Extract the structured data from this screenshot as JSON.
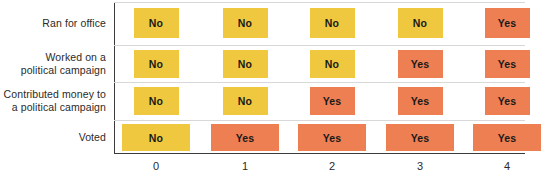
{
  "chart_data": {
    "type": "heatmap",
    "title": "",
    "subtitle": "",
    "xlabel": "",
    "ylabel": "",
    "grid": true,
    "legend_position": "none",
    "x_tick_labels": [
      "0",
      "1",
      "2",
      "3",
      "4"
    ],
    "x_values": [
      0,
      1,
      2,
      3,
      4
    ],
    "categories": [
      "Ran for office",
      "Worked on a\npolitical campaign",
      "Contributed money to\na political campaign",
      "Voted"
    ],
    "value_labels": [
      "No",
      "Yes"
    ],
    "colors": {
      "no": "#EFC840",
      "yes": "#ED7F52",
      "axis": "#3b3b3b",
      "gridline": "#d8d8d8",
      "text": "#2c2a29",
      "cell_text": "#1a1a1a",
      "background": "#ffffff"
    },
    "rows": [
      {
        "label": "Ran for office",
        "cells": [
          {
            "x": "0",
            "value": "No",
            "state": "no"
          },
          {
            "x": "1",
            "value": "No",
            "state": "no"
          },
          {
            "x": "2",
            "value": "No",
            "state": "no"
          },
          {
            "x": "3",
            "value": "No",
            "state": "no"
          },
          {
            "x": "4",
            "value": "Yes",
            "state": "yes"
          }
        ]
      },
      {
        "label": "Worked on a\npolitical campaign",
        "cells": [
          {
            "x": "0",
            "value": "No",
            "state": "no"
          },
          {
            "x": "1",
            "value": "No",
            "state": "no"
          },
          {
            "x": "2",
            "value": "No",
            "state": "no"
          },
          {
            "x": "3",
            "value": "Yes",
            "state": "yes"
          },
          {
            "x": "4",
            "value": "Yes",
            "state": "yes"
          }
        ]
      },
      {
        "label": "Contributed money to\na political campaign",
        "cells": [
          {
            "x": "0",
            "value": "No",
            "state": "no"
          },
          {
            "x": "1",
            "value": "No",
            "state": "no"
          },
          {
            "x": "2",
            "value": "Yes",
            "state": "yes"
          },
          {
            "x": "3",
            "value": "Yes",
            "state": "yes"
          },
          {
            "x": "4",
            "value": "Yes",
            "state": "yes"
          }
        ]
      },
      {
        "label": "Voted",
        "cells": [
          {
            "x": "0",
            "value": "No",
            "state": "no"
          },
          {
            "x": "1",
            "value": "Yes",
            "state": "yes"
          },
          {
            "x": "2",
            "value": "Yes",
            "state": "yes"
          },
          {
            "x": "3",
            "value": "Yes",
            "state": "yes"
          },
          {
            "x": "4",
            "value": "Yes",
            "state": "yes"
          }
        ]
      }
    ]
  },
  "layout": {
    "row_bands": [
      {
        "top": 2,
        "height": 43,
        "cell_top": 8,
        "cell_height": 30,
        "cell_width": 45
      },
      {
        "top": 45,
        "height": 37,
        "cell_top": 50,
        "cell_height": 28,
        "cell_width": 45
      },
      {
        "top": 82,
        "height": 38,
        "cell_top": 87,
        "cell_height": 28,
        "cell_width": 45
      },
      {
        "top": 120,
        "height": 33,
        "cell_top": 124,
        "cell_height": 27,
        "cell_width": 68
      }
    ],
    "column_centers": [
      156,
      245,
      332,
      420,
      507
    ],
    "gridlines": [
      45,
      82,
      120
    ]
  }
}
